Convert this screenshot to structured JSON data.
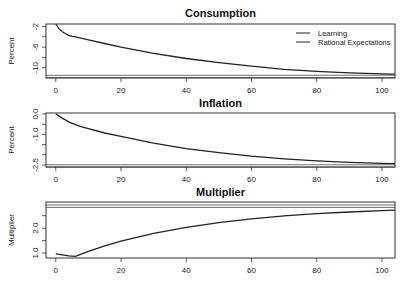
{
  "chart_data": [
    {
      "type": "line",
      "title": "Consumption",
      "xlabel": "",
      "ylabel": "Percent",
      "xlim": [
        -3,
        104
      ],
      "ylim": [
        -12,
        -1.5
      ],
      "xticks": [
        0,
        20,
        40,
        60,
        80,
        100
      ],
      "yticks": [
        -2,
        -4,
        -6,
        -8,
        -10
      ],
      "ytick_labels": [
        "-2",
        "",
        "-6",
        "",
        "-10"
      ],
      "legend": {
        "position": "top-right",
        "entries": [
          "Learning",
          "Rational Expectations"
        ]
      },
      "series": [
        {
          "name": "Learning",
          "x": [
            0,
            1,
            2,
            3,
            4,
            5,
            6,
            8,
            10,
            15,
            20,
            30,
            40,
            50,
            60,
            70,
            80,
            90,
            100,
            104
          ],
          "values": [
            -1.5,
            -2.4,
            -3.0,
            -3.4,
            -3.7,
            -3.9,
            -4.0,
            -4.3,
            -4.6,
            -5.3,
            -6.0,
            -7.2,
            -8.2,
            -9.0,
            -9.7,
            -10.3,
            -10.7,
            -11.0,
            -11.2,
            -11.25
          ]
        },
        {
          "name": "Rational Expectations",
          "x": [
            -3,
            104
          ],
          "values": [
            -11.7,
            -11.7
          ]
        }
      ]
    },
    {
      "type": "line",
      "title": "Inflation",
      "xlabel": "",
      "ylabel": "Percent",
      "xlim": [
        -3,
        104
      ],
      "ylim": [
        -2.6,
        0.05
      ],
      "xticks": [
        0,
        20,
        40,
        60,
        80,
        100
      ],
      "yticks": [
        0.0,
        -0.5,
        -1.0,
        -1.5,
        -2.0,
        -2.5
      ],
      "ytick_labels": [
        "0.0",
        "",
        "-1.0",
        "",
        "",
        "-2.5"
      ],
      "series": [
        {
          "name": "Learning",
          "x": [
            0,
            2,
            4,
            6,
            8,
            10,
            15,
            20,
            30,
            40,
            50,
            60,
            70,
            80,
            90,
            100,
            104
          ],
          "values": [
            0.0,
            -0.2,
            -0.38,
            -0.52,
            -0.63,
            -0.72,
            -0.93,
            -1.1,
            -1.43,
            -1.7,
            -1.9,
            -2.07,
            -2.2,
            -2.3,
            -2.37,
            -2.42,
            -2.44
          ]
        },
        {
          "name": "Rational Expectations",
          "x": [
            -3,
            104
          ],
          "values": [
            -2.55,
            -2.55
          ]
        }
      ]
    },
    {
      "type": "line",
      "title": "Multiplier",
      "xlabel": "",
      "ylabel": "Multiplier",
      "xlim": [
        -3,
        104
      ],
      "ylim": [
        0.8,
        3.05
      ],
      "xticks": [
        0,
        20,
        40,
        60,
        80,
        100
      ],
      "yticks": [
        1.0,
        1.5,
        2.0,
        2.5
      ],
      "ytick_labels": [
        "1.0",
        "",
        "2.0",
        ""
      ],
      "series": [
        {
          "name": "Learning",
          "x": [
            0,
            2,
            4,
            6,
            8,
            10,
            15,
            20,
            30,
            40,
            50,
            60,
            70,
            80,
            90,
            100,
            104
          ],
          "values": [
            0.97,
            0.93,
            0.89,
            0.87,
            0.97,
            1.07,
            1.29,
            1.48,
            1.79,
            2.03,
            2.22,
            2.37,
            2.49,
            2.58,
            2.65,
            2.7,
            2.72
          ]
        },
        {
          "name": "Rational Expectations",
          "x": [
            -3,
            104
          ],
          "values": [
            2.88,
            2.88
          ]
        }
      ]
    }
  ]
}
